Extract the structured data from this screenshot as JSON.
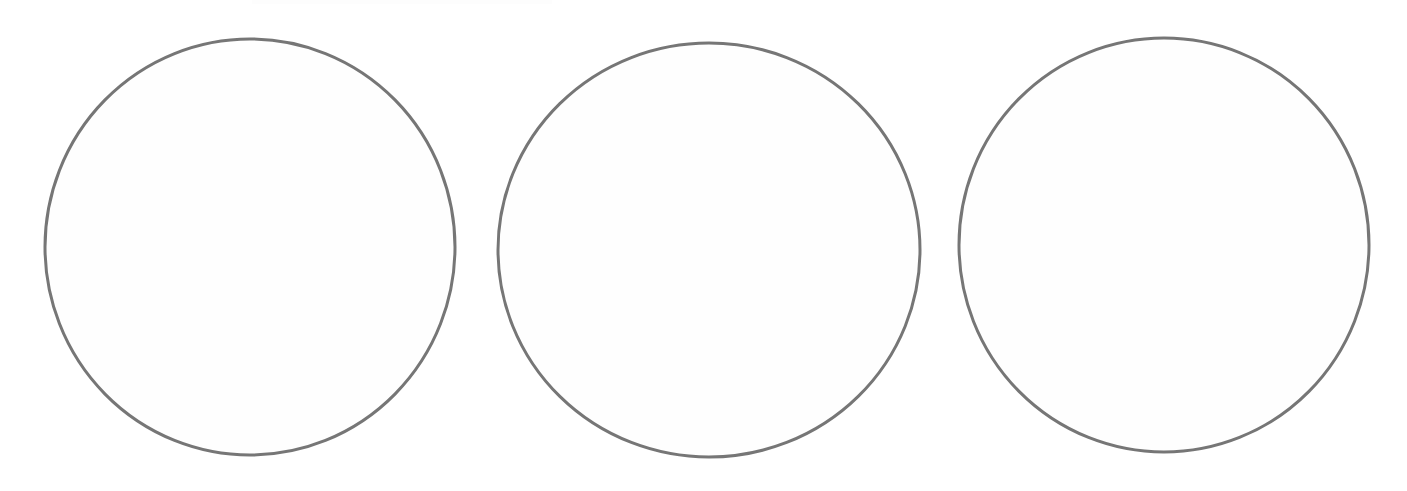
{
  "document": {
    "title": "Three Empty Circles Diagram",
    "background_color": "#ffffff",
    "width": 1407,
    "height": 491,
    "visible_text": "",
    "notes": "Scanned line drawing: three large empty hand-drawn circles in a horizontal row. No labels, captions, axes or numbers are rendered."
  },
  "figure": {
    "type": "line-drawing",
    "shape_count": 3,
    "arrangement": "horizontal-row",
    "stroke_color": "#767676",
    "stroke_width": 3,
    "fill_color": "#fefefe",
    "shapes": [
      {
        "name": "circle-1",
        "shape": "circle",
        "cx": 250,
        "cy": 247,
        "rx": 205,
        "ry": 208,
        "label": "",
        "contents": ""
      },
      {
        "name": "circle-2",
        "shape": "circle",
        "cx": 709,
        "cy": 250,
        "rx": 211,
        "ry": 207,
        "label": "",
        "contents": ""
      },
      {
        "name": "circle-3",
        "shape": "circle",
        "cx": 1164,
        "cy": 245,
        "rx": 205,
        "ry": 207,
        "label": "",
        "contents": ""
      }
    ]
  },
  "artifacts": {
    "top_smudge": {
      "name": "scan-smudge",
      "left": 252,
      "width": 300,
      "description": "very faint residual marks along the top crop edge"
    }
  }
}
